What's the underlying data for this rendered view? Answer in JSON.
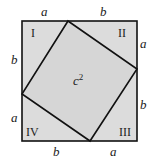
{
  "figure": {
    "fill_color": "#dcdcdc",
    "stroke_color": "#111111",
    "center_label": "c",
    "center_exponent": "2",
    "regions": [
      "I",
      "II",
      "III",
      "IV"
    ],
    "side_labels": {
      "top_left": "a",
      "top_right": "b",
      "right_top": "a",
      "right_bottom": "b",
      "bottom_right": "a",
      "bottom_left": "b",
      "left_bottom": "a",
      "left_top": "b"
    }
  }
}
